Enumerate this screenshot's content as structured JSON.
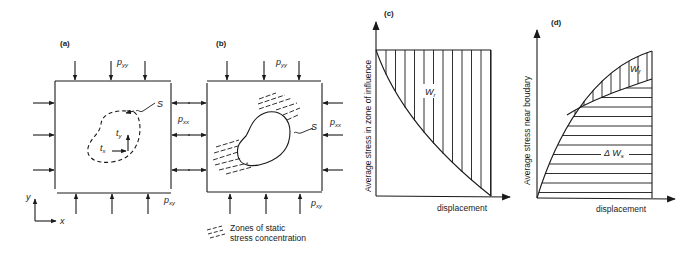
{
  "panels": {
    "a": {
      "label": "(a)",
      "pyy": {
        "base": "p",
        "sub": "yy"
      },
      "pxx": {
        "base": "p",
        "sub": "xx"
      },
      "pxy": {
        "base": "p",
        "sub": "xy"
      },
      "surface": "S",
      "tx": {
        "base": "t",
        "sub": "x"
      },
      "ty": {
        "base": "t",
        "sub": "y"
      },
      "axis_x": "x",
      "axis_y": "y"
    },
    "b": {
      "label": "(b)",
      "pyy": {
        "base": "p",
        "sub": "yy"
      },
      "pxx": {
        "base": "p",
        "sub": "xx"
      },
      "pxy": {
        "base": "p",
        "sub": "xy"
      },
      "surface": "S",
      "legend_line1": "Zones of static",
      "legend_line2": "stress concentration"
    },
    "c": {
      "label": "(c)",
      "ylabel": "Average stress in zone of influence",
      "xlabel": "displacement",
      "area_label": {
        "base": "W",
        "sub": "r"
      }
    },
    "d": {
      "label": "(d)",
      "ylabel": "Average stress near boudary",
      "xlabel": "displacement",
      "area_top_label": {
        "base": "W",
        "sub": "f"
      },
      "area_bottom_label": {
        "base": "Δ W",
        "sub": "s"
      }
    }
  }
}
